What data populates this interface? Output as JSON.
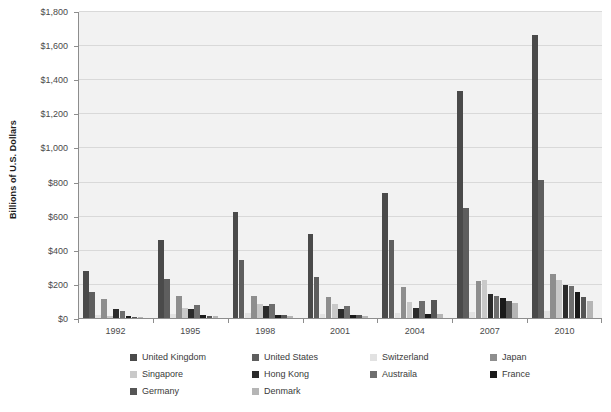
{
  "chart_data": {
    "type": "bar",
    "title": "",
    "subtitle": "",
    "xlabel": "",
    "ylabel": "Billions of U.S. Dollars",
    "ylim": [
      0,
      1800
    ],
    "ytick_step": 200,
    "ytick_labels": [
      "$0",
      "$200",
      "$400",
      "$600",
      "$800",
      "$1,000",
      "$1,200",
      "$1,400",
      "$1,600",
      "$1,800"
    ],
    "ytick_values": [
      0,
      200,
      400,
      600,
      800,
      1000,
      1200,
      1400,
      1600,
      1800
    ],
    "grid": "horizontal",
    "legend_position": "bottom",
    "legend_columns": 4,
    "categories": [
      "1992",
      "1995",
      "1998",
      "2001",
      "2004",
      "2007",
      "2010"
    ],
    "xtick_labels": [
      "1992",
      "1995",
      "1998",
      "2001",
      "2004",
      "2007",
      "2010"
    ],
    "series": [
      {
        "name": "United Kingdom",
        "color": "#4a4a4a",
        "values": [
          275,
          455,
          620,
          490,
          735,
          1330,
          1660
        ]
      },
      {
        "name": "United States",
        "color": "#5e5e5e",
        "values": [
          150,
          230,
          340,
          240,
          455,
          645,
          810
        ]
      },
      {
        "name": "Switzerland",
        "color": "#e2e2e2",
        "values": [
          18,
          22,
          28,
          24,
          30,
          38,
          42
        ]
      },
      {
        "name": "Japan",
        "color": "#8e8e8e",
        "values": [
          110,
          130,
          130,
          125,
          180,
          215,
          260
        ]
      },
      {
        "name": "Singapore",
        "color": "#c9c9c9",
        "values": [
          12,
          60,
          85,
          85,
          95,
          225,
          225
        ]
      },
      {
        "name": "Hong Kong",
        "color": "#2b2b2b",
        "values": [
          50,
          55,
          70,
          50,
          60,
          140,
          195
        ]
      },
      {
        "name": "Austraila",
        "color": "#6e6e6e",
        "values": [
          40,
          75,
          85,
          70,
          100,
          130,
          185
        ]
      },
      {
        "name": "France",
        "color": "#1a1a1a",
        "values": [
          10,
          16,
          20,
          18,
          26,
          115,
          150
        ]
      },
      {
        "name": "Germany",
        "color": "#555555",
        "values": [
          8,
          14,
          18,
          16,
          108,
          100,
          125
        ]
      },
      {
        "name": "Denmark",
        "color": "#b5b5b5",
        "values": [
          6,
          10,
          14,
          12,
          22,
          88,
          100
        ]
      }
    ]
  },
  "legend": {
    "items": [
      {
        "label": "United Kingdom",
        "color": "#4a4a4a"
      },
      {
        "label": "United States",
        "color": "#5e5e5e"
      },
      {
        "label": "Switzerland",
        "color": "#e2e2e2"
      },
      {
        "label": "Japan",
        "color": "#8e8e8e"
      },
      {
        "label": "Singapore",
        "color": "#c9c9c9"
      },
      {
        "label": "Hong Kong",
        "color": "#2b2b2b"
      },
      {
        "label": "Austraila",
        "color": "#6e6e6e"
      },
      {
        "label": "France",
        "color": "#1a1a1a"
      },
      {
        "label": "Germany",
        "color": "#555555"
      },
      {
        "label": "Denmark",
        "color": "#b5b5b5"
      }
    ]
  },
  "axis": {
    "y_title": "Billions of U.S. Dollars"
  }
}
